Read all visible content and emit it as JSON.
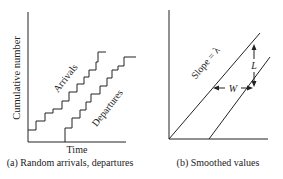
{
  "panel_a": {
    "ylabel": "Cumulative number",
    "xlabel": "Time",
    "arrivals_label": "Arrivals",
    "departures_label": "Departures",
    "caption": "(a) Random arrivals, departures"
  },
  "panel_b": {
    "slope_label": "Slope = λ",
    "L_label": "L",
    "W_label": "W",
    "caption": "(b) Smoothed values"
  },
  "colors": {
    "line": "#222222",
    "background": "#ffffff"
  }
}
